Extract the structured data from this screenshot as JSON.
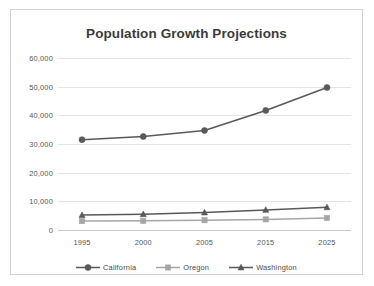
{
  "chart_data": {
    "type": "line",
    "title": "Population Growth Projections",
    "xlabel": "",
    "ylabel": "",
    "categories": [
      "1995",
      "2000",
      "2005",
      "2015",
      "2025"
    ],
    "x": [
      1995,
      2000,
      2005,
      2015,
      2025
    ],
    "ylim": [
      0,
      60000
    ],
    "ytick_values": [
      0,
      10000,
      20000,
      30000,
      40000,
      50000,
      60000
    ],
    "ytick_labels": [
      "0",
      "10,000",
      "20,000",
      "30,000",
      "40,000",
      "50,000",
      "60,000"
    ],
    "grid": true,
    "legend_position": "bottom",
    "series": [
      {
        "name": "California",
        "values": [
          31500,
          32600,
          34700,
          41700,
          49700
        ],
        "color": "#595959",
        "marker": "circle"
      },
      {
        "name": "Oregon",
        "values": [
          3100,
          3200,
          3400,
          3700,
          4200
        ],
        "color": "#a6a6a6",
        "marker": "square"
      },
      {
        "name": "Washington",
        "values": [
          5200,
          5500,
          6100,
          7000,
          7900
        ],
        "color": "#595959",
        "marker": "triangle"
      }
    ]
  },
  "colors": {
    "title": "#3a3a3a",
    "tick": "#555555",
    "gridline": "#e4e4e4",
    "axis": "#c9c9c9",
    "frame_border": "#d4d4d4",
    "background": "#ffffff"
  },
  "legend": {
    "items": [
      {
        "label": "California",
        "icon": "circle-marker-icon"
      },
      {
        "label": "Oregon",
        "icon": "square-marker-icon"
      },
      {
        "label": "Washington",
        "icon": "triangle-marker-icon"
      }
    ]
  }
}
